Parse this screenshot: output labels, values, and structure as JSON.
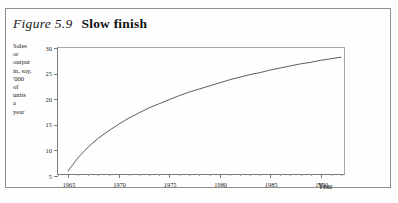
{
  "figure": {
    "number": "Figure 5.9",
    "title": "Slow finish",
    "border_color": "#8d8d8d",
    "axis_color": "#7b7b7b",
    "curve_color": "#4a4a55",
    "background": "#fefefe"
  },
  "chart_data": {
    "type": "line",
    "title": "Slow finish",
    "xlabel": "Year",
    "ylabel": "Sales or output in, say, '000 of units a year",
    "ylabel_lines": [
      "Sales",
      "or",
      "output",
      "in, say,",
      "'000",
      "of",
      "units",
      "a",
      "year"
    ],
    "xlim": [
      1964,
      1992.5
    ],
    "ylim": [
      5,
      30
    ],
    "xticks": [
      1965,
      1970,
      1975,
      1980,
      1985,
      1990
    ],
    "xtick_labels": [
      "1965",
      "1970",
      "1975",
      "1980",
      "1985",
      "1990"
    ],
    "xminor_step": 1,
    "yticks": [
      30,
      25,
      20,
      15,
      10,
      5
    ],
    "ytick_labels": [
      "30",
      "25",
      "20",
      "15",
      "10",
      "5"
    ],
    "grid": false,
    "legend": false,
    "series": [
      {
        "name": "Sales or output",
        "x": [
          1965,
          1966,
          1967,
          1968,
          1969,
          1970,
          1971,
          1972,
          1973,
          1974,
          1975,
          1976,
          1977,
          1978,
          1979,
          1980,
          1981,
          1982,
          1983,
          1984,
          1985,
          1986,
          1987,
          1988,
          1989,
          1990,
          1991,
          1992
        ],
        "values": [
          6.0,
          8.6,
          10.7,
          12.4,
          13.8,
          15.1,
          16.3,
          17.3,
          18.3,
          19.1,
          19.9,
          20.7,
          21.4,
          22.0,
          22.6,
          23.2,
          23.8,
          24.3,
          24.8,
          25.2,
          25.7,
          26.1,
          26.5,
          26.9,
          27.2,
          27.6,
          27.9,
          28.2
        ]
      }
    ]
  }
}
